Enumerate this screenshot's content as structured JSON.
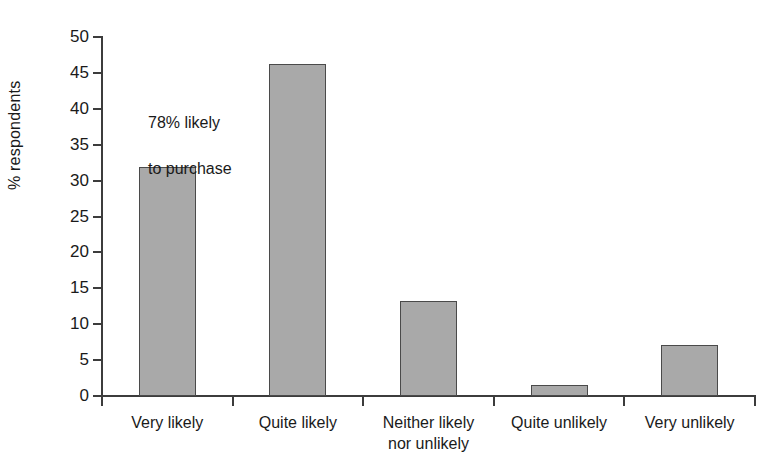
{
  "chart_data": {
    "type": "bar",
    "title": "",
    "xlabel": "",
    "ylabel": "% respondents",
    "categories": [
      "Very likely",
      "Quite likely",
      "Neither likely nor unlikely",
      "Quite unlikely",
      "Very unlikely"
    ],
    "category_lines": [
      [
        "Very likely"
      ],
      [
        "Quite likely"
      ],
      [
        "Neither likely",
        "nor unlikely"
      ],
      [
        "Quite unlikely"
      ],
      [
        "Very unlikely"
      ]
    ],
    "values": [
      31.9,
      46.2,
      13.3,
      1.5,
      7.1
    ],
    "ylim": [
      0,
      50
    ],
    "ytick_step": 5,
    "ytick_labels": [
      "50",
      "45",
      "40",
      "35",
      "30",
      "25",
      "20",
      "15",
      "10",
      "5",
      "0"
    ],
    "ytick_values": [
      50,
      45,
      40,
      35,
      30,
      25,
      20,
      15,
      10,
      5,
      0
    ],
    "grid": false,
    "legend": false,
    "annotations": [
      {
        "id": "purchase-intent-note",
        "text": "78% likely\nto purchase",
        "line1": "78% likely",
        "line2": "to purchase"
      }
    ],
    "colors": {
      "bar_fill": "#a9a9a9",
      "bar_edge": "#4a4a4a",
      "axis": "#3c3c3c",
      "text": "#1a1a1a",
      "background": "#ffffff"
    }
  }
}
